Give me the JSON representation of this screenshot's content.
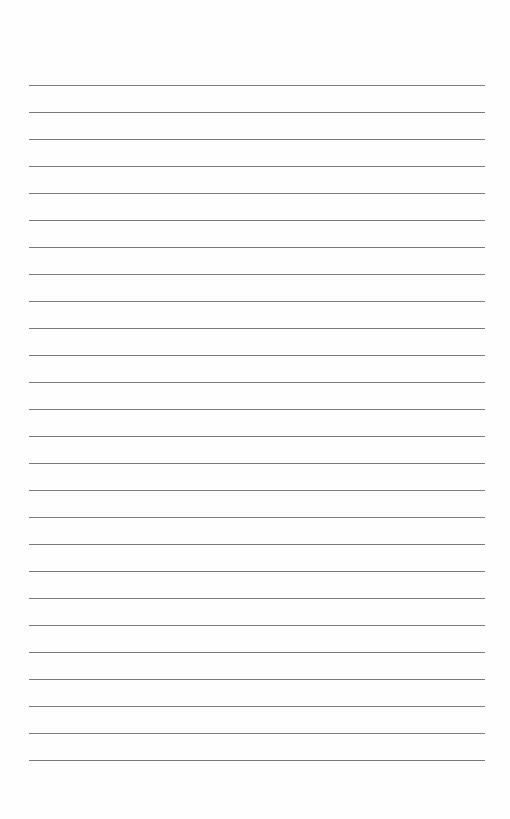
{
  "page": {
    "type": "lined-paper",
    "background_color": "#fefefe",
    "line_color": "#7a7a7a",
    "line_count": 26,
    "first_line_y": 85,
    "line_spacing": 27,
    "line_left": 29,
    "line_width": 456
  }
}
